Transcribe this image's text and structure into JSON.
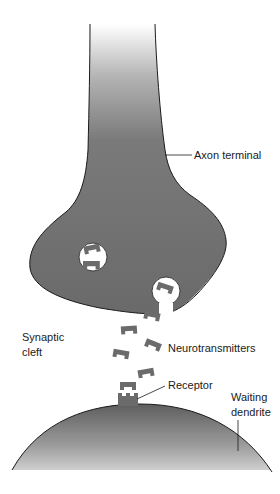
{
  "diagram": {
    "labels": {
      "axon_terminal": "Axon terminal",
      "synaptic_cleft_line1": "Synaptic",
      "synaptic_cleft_line2": "cleft",
      "neurotransmitters": "Neurotransmitters",
      "receptor": "Receptor",
      "waiting_dendrite_line1": "Waiting",
      "waiting_dendrite_line2": "dendrite"
    },
    "colors": {
      "cell_fill": "#6e6e6e",
      "cell_outline": "#1a1a1a",
      "neurotransmitter": "#6b6b6b",
      "vesicle_fill": "#ffffff",
      "background": "#ffffff"
    },
    "neurotransmitter_count_free": 6,
    "vesicle_count": 2
  }
}
